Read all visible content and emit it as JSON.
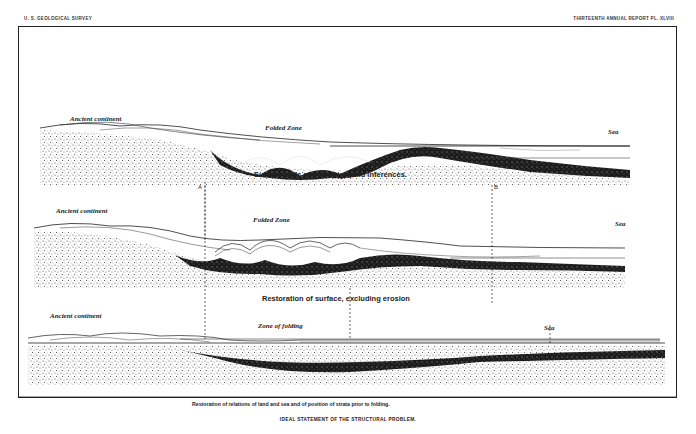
{
  "header": {
    "left": "U. S. GEOLOGICAL SURVEY",
    "right": "THIRTEENTH ANNUAL REPORT   PL. XLVIII"
  },
  "sections": [
    {
      "labels": {
        "continent": "Ancient continent",
        "zone": "Folded Zone",
        "sea": "Sea"
      },
      "caption": "Surface facts and underground inferences."
    },
    {
      "labels": {
        "continent": "Ancient continent",
        "zone": "Folded Zone",
        "sea": "Sea"
      },
      "caption": "Restoration of surface, excluding erosion"
    },
    {
      "labels": {
        "continent": "Ancient continent",
        "zone": "Zone of folding",
        "sea": "Sea"
      },
      "caption": "Restoration of relations of land and sea and of position of strata prior to folding."
    }
  ],
  "markers": {
    "a": "A",
    "b": "B"
  },
  "plate_title": "IDEAL STATEMENT OF THE STRUCTURAL PROBLEM.",
  "colors": {
    "ink": "#1a1a1a",
    "paper": "#ffffff",
    "stipple": "#555555"
  }
}
